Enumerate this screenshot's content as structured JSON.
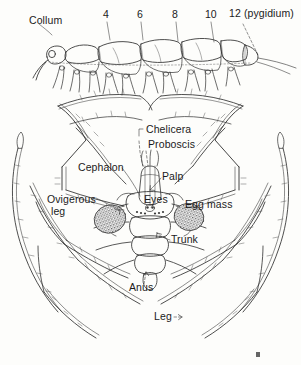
{
  "figure": {
    "kind": "scientific-line-illustration",
    "background_color": "#fdfdfb",
    "ink_color": "#2b2b2b",
    "panels": [
      {
        "id": "millipede-segments",
        "caption_labels": [
          "Collum",
          "4",
          "6",
          "8",
          "10",
          "12 (pygidium)"
        ]
      },
      {
        "id": "sea-spider-dorsal",
        "caption_labels": [
          "Chelicera",
          "Proboscis",
          "Cephalon",
          "Palp",
          "Ovigerous leg",
          "Eyes",
          "Egg mass",
          "Trunk",
          "Anus",
          "Leg"
        ]
      }
    ]
  },
  "top_panel": {
    "collum_label": "Collum",
    "segment_numbers": [
      "4",
      "6",
      "8",
      "10"
    ],
    "pygidium_label": "12 (pygidium)"
  },
  "bottom_panel": {
    "chelicera_label": "Chelicera",
    "proboscis_label": "Proboscis",
    "cephalon_label": "Cephalon",
    "palp_label": "Palp",
    "ovigerous_label": "Ovigerous",
    "leg_word_label": "leg",
    "eyes_label": "Eyes",
    "egg_mass_label": "Egg mass",
    "trunk_label": "Trunk",
    "anus_label": "Anus",
    "leg_label": "Leg"
  }
}
